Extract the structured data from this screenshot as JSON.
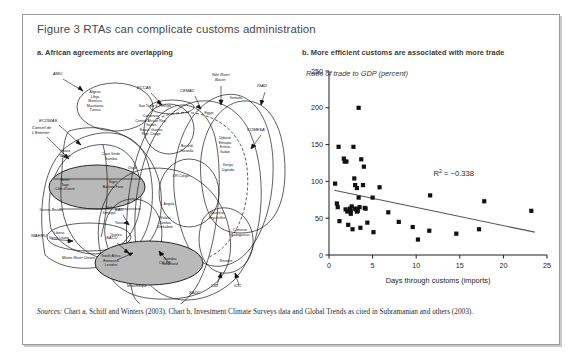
{
  "figure": {
    "title": "Figure 3  RTAs can complicate customs administration",
    "panel_a_title": "a. African agreements are overlapping",
    "panel_b_title": "b. More efficient customs are associated with more trade",
    "source_label": "Sources:",
    "source_text": " Chart a, Schiff and Winters (2003). Chart b, Investment Climate Surveys data and Global Trends as cited in Subramanian and others (2003)."
  },
  "diagram": {
    "acronyms": [
      {
        "id": "amu",
        "label": "AMU",
        "x": 24,
        "y": 16
      },
      {
        "id": "ecowas",
        "label": "ECOWAS",
        "x": 10,
        "y": 63
      },
      {
        "id": "conseil",
        "label": "Conseil de",
        "x": 3,
        "y": 70
      },
      {
        "id": "conseil2",
        "label": "L'Entente",
        "x": 3,
        "y": 75
      },
      {
        "id": "eccas",
        "label": "ECCAS",
        "x": 108,
        "y": 30
      },
      {
        "id": "cemac",
        "label": "CEMAC",
        "x": 151,
        "y": 33
      },
      {
        "id": "nile",
        "label": "Nile River",
        "x": 183,
        "y": 17
      },
      {
        "id": "nile2",
        "label": "Basin",
        "x": 186,
        "y": 22
      },
      {
        "id": "igad",
        "label": "IGAD",
        "x": 228,
        "y": 28
      },
      {
        "id": "comesa",
        "label": "COMESA",
        "x": 218,
        "y": 72
      },
      {
        "id": "waemu",
        "label": "WAEMU",
        "x": 2,
        "y": 178
      },
      {
        "id": "mano",
        "label": "Mano River Union",
        "x": 33,
        "y": 200
      },
      {
        "id": "cilss",
        "label": "CILSS",
        "x": 130,
        "y": 205
      },
      {
        "id": "eac",
        "label": "EAC",
        "x": 86,
        "y": 152
      },
      {
        "id": "sacu",
        "label": "SACU",
        "x": 77,
        "y": 180
      },
      {
        "id": "cbi",
        "label": "CBI",
        "x": 182,
        "y": 228
      },
      {
        "id": "ioc",
        "label": "IOC",
        "x": 205,
        "y": 228
      },
      {
        "id": "sadc",
        "label": "SADC",
        "x": 160,
        "y": 235
      }
    ],
    "country_groups": [
      {
        "id": "amu-members",
        "x": 66,
        "y": 34,
        "lines": [
          "Algeria",
          "Libya",
          "Morocco",
          "Mauritania",
          "Tunisia"
        ]
      },
      {
        "id": "ghana-nigeria",
        "x": 36,
        "y": 93,
        "lines": [
          "Ghana",
          "Nigeria"
        ]
      },
      {
        "id": "capeverde-gambia",
        "x": 82,
        "y": 96,
        "lines": [
          "Cape Verde",
          "Gambia"
        ]
      },
      {
        "id": "benin-togo-civ",
        "x": 36,
        "y": 122,
        "lines": [
          "Benin",
          "Togo",
          "Côte d'Ivoire"
        ]
      },
      {
        "id": "niger-burkina",
        "x": 84,
        "y": 124,
        "lines": [
          "Niger",
          "Burkina Faso"
        ]
      },
      {
        "id": "guinea-bissau",
        "x": 22,
        "y": 152,
        "lines": [
          "Guinea-Bissau"
        ]
      },
      {
        "id": "mali-senegal",
        "x": 80,
        "y": 150,
        "lines": [
          "Mali",
          "Senegal"
        ]
      },
      {
        "id": "liberia-sierraleone",
        "x": 30,
        "y": 175,
        "lines": [
          "Liberia",
          "Sierra Leone"
        ]
      },
      {
        "id": "guinea",
        "x": 87,
        "y": 177,
        "lines": [
          "Guinea"
        ]
      },
      {
        "id": "chad",
        "x": 103,
        "y": 110,
        "lines": [
          "Chad"
        ]
      },
      {
        "id": "saotome",
        "x": 126,
        "y": 48,
        "lines": [
          "Sao Tome & Principe"
        ]
      },
      {
        "id": "cemac-members",
        "x": 122,
        "y": 58,
        "lines": [
          "Cameroon",
          "Central African Rep.",
          "Gabon",
          "Equat. Guinea",
          "Rep. Congo"
        ]
      },
      {
        "id": "egypt",
        "x": 180,
        "y": 55,
        "lines": [
          "Egypt"
        ]
      },
      {
        "id": "somalia",
        "x": 207,
        "y": 40,
        "lines": [
          "Somalia"
        ]
      },
      {
        "id": "burundi-rwanda",
        "x": 158,
        "y": 88,
        "lines": [
          "Burundi",
          "Rwanda"
        ]
      },
      {
        "id": "djibouti-group",
        "x": 196,
        "y": 80,
        "lines": [
          "Djibouti",
          "Ethiopia",
          "Eritrea",
          "Sudan"
        ]
      },
      {
        "id": "kenya-uganda",
        "x": 199,
        "y": 107,
        "lines": [
          "Kenya",
          "Uganda"
        ]
      },
      {
        "id": "drcongo",
        "x": 152,
        "y": 118,
        "lines": [
          "DR Congo"
        ]
      },
      {
        "id": "angola",
        "x": 140,
        "y": 146,
        "lines": [
          "Angola"
        ]
      },
      {
        "id": "tanzania",
        "x": 93,
        "y": 165,
        "lines": [
          "Tanzania"
        ]
      },
      {
        "id": "malawi-group",
        "x": 136,
        "y": 160,
        "lines": [
          "Malawi",
          "Zambia",
          "Zimbabwe"
        ]
      },
      {
        "id": "mauritius-seychelles",
        "x": 188,
        "y": 155,
        "lines": [
          "Mauritius",
          "Seychelles"
        ]
      },
      {
        "id": "comoros-madagascar",
        "x": 211,
        "y": 172,
        "lines": [
          "Comoros",
          "Madagascar"
        ]
      },
      {
        "id": "southafrica-group",
        "x": 82,
        "y": 198,
        "lines": [
          "South Africa",
          "Botswana",
          "Lesotho"
        ]
      },
      {
        "id": "namibia-swaziland",
        "x": 141,
        "y": 201,
        "lines": [
          "Namibia",
          "Swaziland"
        ]
      },
      {
        "id": "reunion",
        "x": 197,
        "y": 203,
        "lines": [
          "Reunion"
        ]
      },
      {
        "id": "mozambique",
        "x": 108,
        "y": 228,
        "lines": [
          "Mozambique"
        ]
      }
    ]
  },
  "chart_data": {
    "type": "scatter",
    "title": "b. More efficient customs are associated with more trade",
    "ylabel": "Ratio of trade to GDP (percent)",
    "xlabel": "Days through customs (imports)",
    "xlim": [
      0,
      25
    ],
    "ylim": [
      0,
      250
    ],
    "xticks": [
      0,
      5,
      10,
      15,
      20,
      25
    ],
    "yticks": [
      0,
      50,
      100,
      150,
      200,
      250
    ],
    "grid": false,
    "annotation": "R² = −0.338",
    "annotation_x": 14.3,
    "annotation_y": 108,
    "trendline": {
      "x": [
        0.6,
        23.6
      ],
      "y": [
        88,
        31
      ]
    },
    "points": [
      [
        0.7,
        97
      ],
      [
        0.9,
        70
      ],
      [
        1.0,
        65
      ],
      [
        1.1,
        147
      ],
      [
        1.2,
        46
      ],
      [
        1.7,
        131
      ],
      [
        1.8,
        127
      ],
      [
        2.0,
        127
      ],
      [
        1.9,
        62
      ],
      [
        2.1,
        59
      ],
      [
        2.2,
        41
      ],
      [
        2.4,
        63
      ],
      [
        2.5,
        60
      ],
      [
        2.5,
        56
      ],
      [
        2.6,
        66
      ],
      [
        2.7,
        35
      ],
      [
        2.8,
        147
      ],
      [
        2.9,
        104
      ],
      [
        3.0,
        95
      ],
      [
        3.0,
        63
      ],
      [
        3.1,
        62
      ],
      [
        3.2,
        91
      ],
      [
        3.2,
        59
      ],
      [
        3.3,
        60
      ],
      [
        3.4,
        200
      ],
      [
        3.4,
        78
      ],
      [
        3.5,
        65
      ],
      [
        3.6,
        37
      ],
      [
        3.7,
        130
      ],
      [
        3.9,
        95
      ],
      [
        4.0,
        120
      ],
      [
        4.1,
        64
      ],
      [
        4.2,
        63
      ],
      [
        4.4,
        44
      ],
      [
        5.0,
        78
      ],
      [
        5.1,
        31
      ],
      [
        5.8,
        92
      ],
      [
        6.8,
        58
      ],
      [
        8.0,
        45
      ],
      [
        9.6,
        38
      ],
      [
        10.2,
        21
      ],
      [
        11.5,
        33
      ],
      [
        11.6,
        81
      ],
      [
        14.6,
        29
      ],
      [
        17.2,
        35
      ],
      [
        17.8,
        73
      ],
      [
        23.2,
        60
      ]
    ]
  }
}
